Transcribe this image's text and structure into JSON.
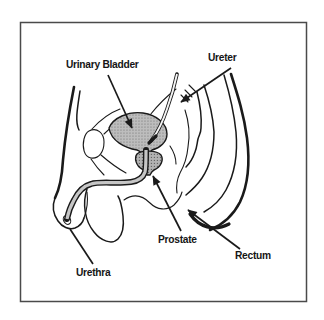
{
  "diagram": {
    "labels": {
      "urinary_bladder": "Urinary Bladder",
      "ureter": "Ureter",
      "prostate": "Prostate",
      "rectum": "Rectum",
      "urethra": "Urethra"
    },
    "colors": {
      "line": "#1a1a1a",
      "frame": "#4a4a4a",
      "background": "#ffffff",
      "bladder_fill": "#bdbdbd",
      "prostate_fill": "#b2b2b2",
      "tube_fill": "#c6c6c6",
      "ureter_fill": "#f5f5f5"
    }
  }
}
